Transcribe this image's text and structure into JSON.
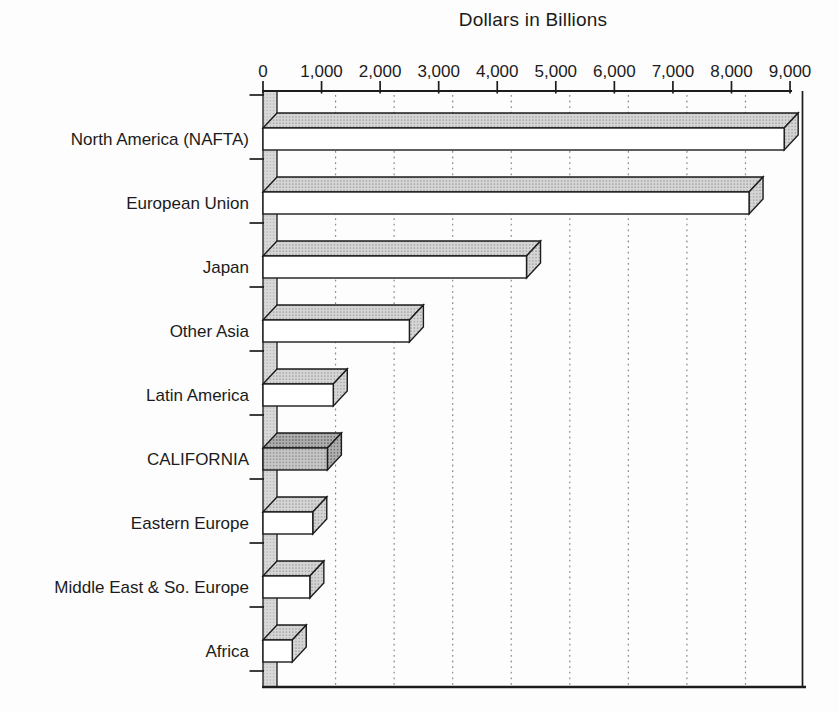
{
  "title": "Dollars in Billions",
  "colors": {
    "ink": "#1c1c1c",
    "bar_front": "#ffffff",
    "bar_top_base": "#d6d6d6",
    "bar_top_dot": "#8f8f8f",
    "highlight_top_base": "#b0b0b0",
    "highlight_top_dot": "#5f5f5f",
    "highlight_front_base": "#c6c6c6",
    "highlight_front_dot": "#787878",
    "wall_base": "#d9d9d9",
    "wall_dot": "#9a9a9a",
    "grid_dot": "#8a8a8a"
  },
  "chart_data": {
    "type": "bar",
    "orientation": "horizontal",
    "style": "3d-scanned-print",
    "title": "Dollars in Billions",
    "xlabel": "Dollars in Billions",
    "ylabel": "",
    "categories": [
      "North America (NAFTA)",
      "European Union",
      "Japan",
      "Other Asia",
      "Latin America",
      "CALIFORNIA",
      "Eastern Europe",
      "Middle East & So. Europe",
      "Africa"
    ],
    "values": [
      8900,
      8300,
      4500,
      2500,
      1200,
      1100,
      850,
      800,
      500
    ],
    "highlighted_category": "CALIFORNIA",
    "xlim": [
      0,
      9000
    ],
    "x_ticks": [
      0,
      1000,
      2000,
      3000,
      4000,
      5000,
      6000,
      7000,
      8000,
      9000
    ],
    "x_tick_labels": [
      "0",
      "1,000",
      "2,000",
      "3,000",
      "4,000",
      "5,000",
      "6,000",
      "7,000",
      "8,000",
      "9,000"
    ],
    "grid": "vertical-dotted",
    "axis_position": "top",
    "legend": "none"
  }
}
